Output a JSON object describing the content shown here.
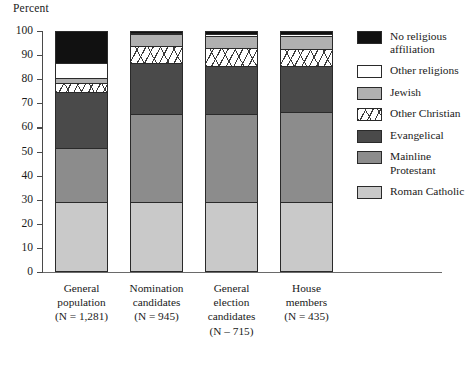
{
  "chart_data": {
    "type": "bar",
    "subtype": "stacked-100-percent",
    "title": "",
    "xlabel": "",
    "ylabel": "Percent",
    "ylim": [
      0,
      100
    ],
    "ytick_labels": [
      "100",
      "90",
      "80",
      "70",
      "60",
      "50",
      "40",
      "30",
      "20",
      "10",
      "0"
    ],
    "ytick_values": [
      100,
      90,
      80,
      70,
      60,
      50,
      40,
      30,
      20,
      10,
      0
    ],
    "grid": false,
    "legend_position": "right",
    "categories": [
      "General population",
      "Nomination candidates",
      "General election candidates",
      "House members"
    ],
    "category_labels": [
      [
        "General",
        "population",
        "(N = 1,281)"
      ],
      [
        "Nomination",
        "candidates",
        "(N = 945)"
      ],
      [
        "General",
        "election",
        "candidates",
        "(N – 715)"
      ],
      [
        "House",
        "members",
        "(N = 435)"
      ]
    ],
    "sample_sizes": [
      "(N = 1,281)",
      "(N = 945)",
      "(N – 715)",
      "(N = 435)"
    ],
    "series": [
      {
        "name": "Roman Catholic",
        "values": [
          29.5,
          29.5,
          29.5,
          29.5
        ],
        "color": "#c9c9c9",
        "pattern": "solid"
      },
      {
        "name": "Mainline Protestant",
        "values": [
          22.5,
          36.5,
          36.5,
          37.5
        ],
        "color": "#8c8c8c",
        "pattern": "solid"
      },
      {
        "name": "Evangelical",
        "values": [
          23.0,
          21.0,
          20.0,
          19.0
        ],
        "color": "#4a4a4a",
        "pattern": "solid"
      },
      {
        "name": "Other Christian",
        "values": [
          4.0,
          7.0,
          7.5,
          7.0
        ],
        "color": "#ffffff",
        "pattern": "hatched"
      },
      {
        "name": "Jewish",
        "values": [
          2.0,
          5.0,
          5.0,
          5.5
        ],
        "color": "#b0b0b0",
        "pattern": "solid"
      },
      {
        "name": "Other religions",
        "values": [
          6.0,
          0.5,
          0.5,
          0.5
        ],
        "color": "#ffffff",
        "pattern": "solid"
      },
      {
        "name": "No religious affiliation",
        "values": [
          13.0,
          0.5,
          1.0,
          1.0
        ],
        "color": "#111111",
        "pattern": "solid"
      }
    ]
  },
  "legend": {
    "entries": [
      {
        "label_lines": [
          "No religious",
          "affiliation"
        ],
        "color": "#111111",
        "pattern": "solid"
      },
      {
        "label_lines": [
          "Other religions"
        ],
        "color": "#ffffff",
        "pattern": "solid"
      },
      {
        "label_lines": [
          "Jewish"
        ],
        "color": "#b0b0b0",
        "pattern": "solid"
      },
      {
        "label_lines": [
          "Other Christian"
        ],
        "color": "#ffffff",
        "pattern": "hatched"
      },
      {
        "label_lines": [
          "Evangelical"
        ],
        "color": "#4a4a4a",
        "pattern": "solid"
      },
      {
        "label_lines": [
          "Mainline",
          "Protestant"
        ],
        "color": "#8c8c8c",
        "pattern": "solid"
      },
      {
        "label_lines": [
          "Roman Catholic"
        ],
        "color": "#c9c9c9",
        "pattern": "solid"
      }
    ]
  },
  "colors": {
    "background": "#ffffff",
    "axis": "#4a4a4a",
    "text": "#1a1a1a",
    "bar_border": "#2a2a2a"
  }
}
